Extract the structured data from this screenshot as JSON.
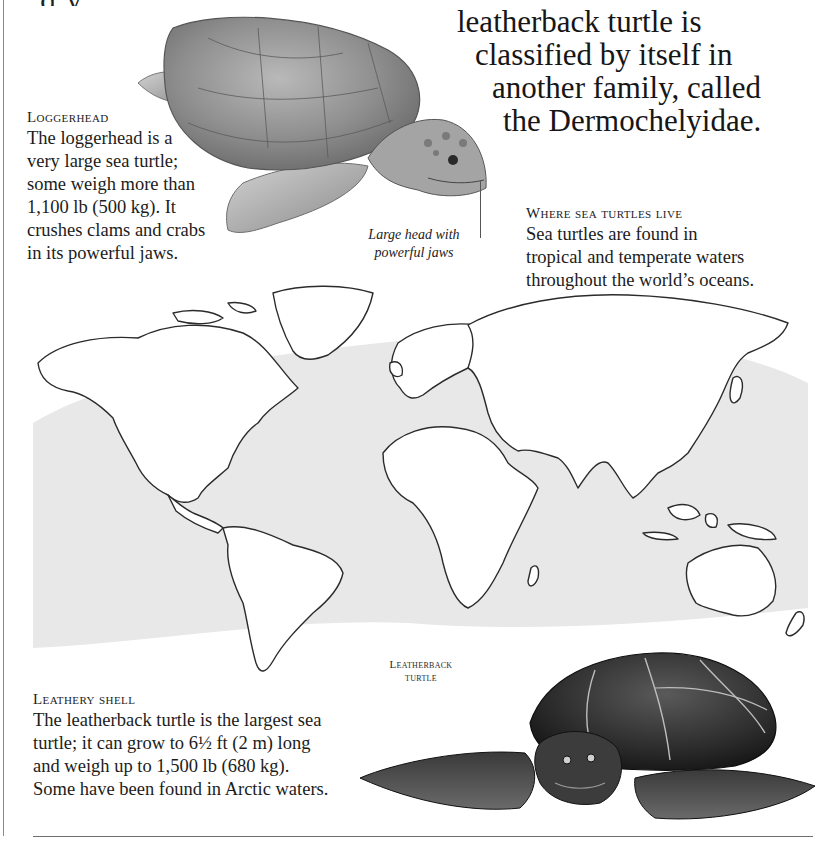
{
  "page": {
    "top_partial_line": "g                                                     y,",
    "intro_paragraph": {
      "lines": [
        "leatherback turtle is",
        "classified by itself in",
        "another family, called",
        "the Dermochelyidae."
      ]
    },
    "loggerhead": {
      "heading": "Loggerhead",
      "body": "The loggerhead is a very large sea turtle; some weigh more than 1,100 lb (500 kg). It crushes clams and crabs in its powerful jaws.",
      "body_lines": [
        "The loggerhead is a",
        "very large sea turtle;",
        "some weigh more than",
        "1,100 lb (500 kg). It",
        "crushes clams and crabs",
        "in its powerful jaws."
      ],
      "illustration_label_lines": [
        "Large head with",
        "powerful jaws"
      ]
    },
    "where_sea_turtles_live": {
      "heading": "Where sea turtles live",
      "body_lines": [
        "Sea turtles are found in",
        "tropical and temperate waters",
        "throughout the world’s oceans."
      ]
    },
    "map": {
      "description": "World map outline with shaded tropical and temperate ocean zones showing sea turtle range",
      "range_shading_color": "#e6e6e6",
      "coastline_color": "#2b2b2b"
    },
    "leatherback": {
      "species_label_lines": [
        "Leatherback",
        "turtle"
      ],
      "heading": "Leathery shell",
      "body_lines": [
        "The leatherback turtle is the largest sea",
        "turtle; it can grow to 6½ ft (2 m) long",
        "and weigh up to 1,500 lb (680 kg).",
        "Some have been found in Arctic waters."
      ]
    }
  }
}
